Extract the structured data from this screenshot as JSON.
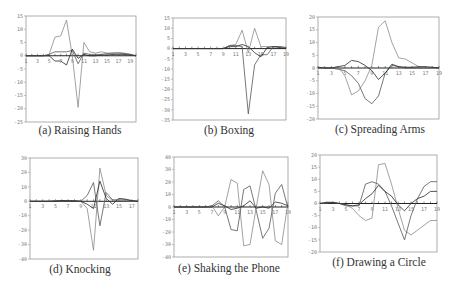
{
  "figure": {
    "panels": [
      {
        "id": "a",
        "caption": "(a) Raising Hands"
      },
      {
        "id": "b",
        "caption": "(b) Boxing"
      },
      {
        "id": "c",
        "caption": "(c) Spreading Arms"
      },
      {
        "id": "d",
        "caption": "(d) Knocking"
      },
      {
        "id": "e",
        "caption": "(e) Shaking the Phone"
      },
      {
        "id": "f",
        "caption": "(f) Drawing a Circle"
      }
    ]
  },
  "colors": {
    "frame": "#9a9a9a",
    "zero_line": "#222222",
    "series": [
      "#8a8a8a",
      "#555555",
      "#2a2a2a"
    ]
  },
  "chart_data": [
    {
      "type": "line",
      "title": "(a) Raising Hands",
      "xlabel": "",
      "ylabel": "",
      "x_ticks": [
        1,
        3,
        5,
        7,
        9,
        11,
        13,
        15,
        17,
        19
      ],
      "y_ticks": [
        15,
        10,
        5,
        0,
        -5,
        -10,
        -15,
        -20,
        -25
      ],
      "ylim": [
        -25,
        15
      ],
      "xlim": [
        1,
        20
      ],
      "grid": false,
      "x": [
        1,
        2,
        3,
        4,
        5,
        6,
        7,
        8,
        9,
        10,
        11,
        12,
        13,
        14,
        15,
        16,
        17,
        18,
        19,
        20
      ],
      "series": [
        {
          "name": "series-1",
          "values": [
            0,
            0,
            0,
            0,
            0.5,
            7,
            7.5,
            13.5,
            0,
            -19.5,
            5,
            1.5,
            1,
            1.5,
            1,
            1,
            1.2,
            1,
            0.5,
            0
          ]
        },
        {
          "name": "series-2",
          "values": [
            0,
            0,
            0,
            0,
            0.5,
            1.5,
            1.5,
            1.5,
            2,
            -3,
            1,
            0.5,
            0.5,
            0.5,
            0.8,
            1,
            1,
            0.8,
            0.5,
            0
          ]
        },
        {
          "name": "series-3",
          "values": [
            0,
            0,
            0,
            0,
            0,
            -2,
            -2,
            -3.5,
            2.5,
            -1,
            0.5,
            0,
            0,
            0.3,
            0.3,
            0.5,
            0.5,
            0.5,
            0.3,
            0
          ]
        }
      ]
    },
    {
      "type": "line",
      "title": "(b) Boxing",
      "xlabel": "",
      "ylabel": "",
      "x_ticks": [
        1,
        3,
        5,
        7,
        9,
        11,
        13,
        15,
        17,
        19
      ],
      "y_ticks": [
        15,
        10,
        5,
        0,
        -5,
        -10,
        -15,
        -20,
        -25,
        -30,
        -35
      ],
      "ylim": [
        -35,
        15
      ],
      "xlim": [
        1,
        19
      ],
      "grid": false,
      "x": [
        1,
        2,
        3,
        4,
        5,
        6,
        7,
        8,
        9,
        10,
        11,
        12,
        13,
        14,
        15,
        16,
        17,
        18,
        19
      ],
      "series": [
        {
          "name": "series-1",
          "values": [
            0,
            0,
            0,
            0,
            0,
            0,
            0,
            0,
            0,
            1.5,
            2,
            9,
            -2,
            10,
            1,
            1,
            1,
            1,
            0.5
          ]
        },
        {
          "name": "series-2",
          "values": [
            0,
            0,
            0,
            0,
            0,
            0,
            0,
            0,
            0,
            1.5,
            1.5,
            1,
            -32,
            -8,
            -3,
            -3,
            1,
            1,
            0.5
          ]
        },
        {
          "name": "series-3",
          "values": [
            0,
            0,
            0,
            0,
            0,
            0,
            0,
            0,
            0,
            1,
            1,
            2,
            1,
            -2,
            -4,
            0.5,
            1,
            0.5,
            0
          ]
        }
      ]
    },
    {
      "type": "line",
      "title": "(c) Spreading Arms",
      "xlabel": "",
      "ylabel": "",
      "x_ticks": [
        1,
        3,
        5,
        7,
        9,
        11,
        13,
        15,
        17,
        19
      ],
      "y_ticks": [
        20,
        15,
        10,
        5,
        0,
        -5,
        -10,
        -15,
        -20
      ],
      "ylim": [
        -20,
        20
      ],
      "xlim": [
        1,
        19
      ],
      "grid": false,
      "x": [
        1,
        2,
        3,
        4,
        5,
        6,
        7,
        8,
        9,
        10,
        11,
        12,
        13,
        14,
        15,
        16,
        17,
        18,
        19
      ],
      "series": [
        {
          "name": "series-1",
          "values": [
            0,
            0,
            0,
            0.5,
            -3,
            -10.5,
            -9,
            -5,
            1,
            16,
            18.5,
            10,
            4,
            3.5,
            2,
            0.5,
            0.3,
            0,
            0
          ]
        },
        {
          "name": "series-2",
          "values": [
            0,
            0,
            0,
            -0.5,
            -1,
            -3,
            -6,
            -12,
            -14,
            -11,
            -2,
            1,
            0.5,
            0,
            0,
            0,
            0,
            0,
            0
          ]
        },
        {
          "name": "series-3",
          "values": [
            0.3,
            0,
            0,
            0.5,
            1,
            3,
            2.5,
            1,
            -1,
            -4.5,
            -2,
            1.5,
            0.5,
            0.3,
            0.3,
            0.5,
            0.5,
            0.3,
            0
          ]
        }
      ]
    },
    {
      "type": "line",
      "title": "(d) Knocking",
      "xlabel": "",
      "ylabel": "",
      "x_ticks": [
        1,
        3,
        5,
        7,
        9,
        11,
        13,
        15,
        17
      ],
      "y_ticks": [
        30,
        20,
        10,
        0,
        -10,
        -20,
        -30,
        -40
      ],
      "ylim": [
        -40,
        30
      ],
      "xlim": [
        1,
        18
      ],
      "grid": false,
      "x": [
        1,
        2,
        3,
        4,
        5,
        6,
        7,
        8,
        9,
        10,
        11,
        12,
        13,
        14,
        15,
        16,
        17,
        18
      ],
      "series": [
        {
          "name": "series-1",
          "values": [
            0,
            0,
            0,
            0,
            0.5,
            0.5,
            0.5,
            0.5,
            0,
            -5,
            -34,
            23,
            4,
            0.5,
            0.5,
            0.5,
            0.3,
            0
          ]
        },
        {
          "name": "series-2",
          "values": [
            0,
            0,
            0,
            0,
            0.5,
            0.5,
            0.5,
            0.5,
            0,
            4,
            13,
            -17,
            6,
            1,
            1,
            1,
            0.5,
            0
          ]
        },
        {
          "name": "series-3",
          "values": [
            0,
            0,
            0,
            0,
            0,
            0.5,
            0.3,
            0.3,
            0,
            -2,
            -5,
            14,
            2,
            -2,
            2,
            1.5,
            0.5,
            0
          ]
        }
      ]
    },
    {
      "type": "line",
      "title": "(e) Shaking the Phone",
      "xlabel": "",
      "ylabel": "",
      "x_ticks": [
        1,
        3,
        5,
        7,
        9,
        11,
        13,
        15,
        17,
        19
      ],
      "y_ticks": [
        40,
        30,
        20,
        10,
        0,
        -10,
        -20,
        -30,
        -40
      ],
      "ylim": [
        -40,
        40
      ],
      "xlim": [
        1,
        19
      ],
      "grid": false,
      "x": [
        1,
        2,
        3,
        4,
        5,
        6,
        7,
        8,
        9,
        10,
        11,
        12,
        13,
        14,
        15,
        16,
        17,
        18,
        19
      ],
      "series": [
        {
          "name": "series-1",
          "values": [
            0,
            0,
            0,
            0,
            0,
            0,
            1,
            -7,
            0,
            22,
            19,
            -31,
            -30,
            0,
            29,
            18,
            -27,
            -30,
            4
          ]
        },
        {
          "name": "series-2",
          "values": [
            0,
            0,
            0,
            0,
            0,
            0,
            1,
            5,
            0,
            -18,
            -19,
            14,
            17,
            -3,
            -25,
            -17,
            11,
            18,
            -1
          ]
        },
        {
          "name": "series-3",
          "values": [
            0,
            0,
            0,
            0,
            0,
            0,
            0,
            3,
            1,
            -2,
            -1,
            1,
            5,
            -1,
            0,
            -1,
            4,
            3,
            1
          ]
        }
      ]
    },
    {
      "type": "line",
      "title": "(f) Drawing a Circle",
      "xlabel": "",
      "ylabel": "",
      "x_ticks": [
        1,
        3,
        5,
        7,
        9,
        11,
        13,
        15,
        17,
        19
      ],
      "y_ticks": [
        20,
        15,
        10,
        5,
        0,
        -5,
        -10,
        -15,
        -20
      ],
      "ylim": [
        -20,
        20
      ],
      "xlim": [
        1,
        19
      ],
      "grid": false,
      "x": [
        1,
        2,
        3,
        4,
        5,
        6,
        7,
        8,
        9,
        10,
        11,
        12,
        13,
        14,
        15,
        16,
        17,
        18,
        19
      ],
      "series": [
        {
          "name": "series-1",
          "values": [
            0,
            0.3,
            0.5,
            0,
            -0.5,
            -2,
            -5,
            -7,
            -6,
            16,
            16.5,
            8,
            -2,
            -11,
            -13,
            -11,
            -9,
            -7,
            -7
          ]
        },
        {
          "name": "series-2",
          "values": [
            0,
            0.3,
            0.3,
            0,
            -1,
            -1,
            -1,
            8,
            9,
            8,
            5,
            -1,
            -8,
            -15,
            -5,
            2,
            7,
            9,
            9
          ]
        },
        {
          "name": "series-3",
          "values": [
            0,
            0.5,
            0.5,
            0,
            -0.5,
            -1,
            -0.5,
            2,
            4,
            7.5,
            5,
            3,
            -0.5,
            -3,
            0,
            2,
            3,
            5,
            5
          ]
        }
      ]
    }
  ]
}
